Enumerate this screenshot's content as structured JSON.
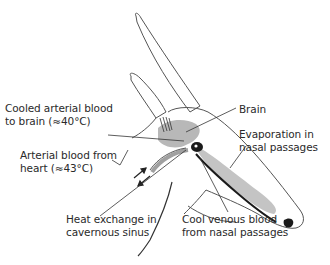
{
  "figure": {
    "colors": {
      "outline": "#555555",
      "shading": "#b8b8b8",
      "dark_vessel": "#1a1a1a",
      "text": "#2a2a2a",
      "background": "#ffffff"
    }
  },
  "labels": {
    "cooled_arterial": {
      "line1": "Cooled arterial blood",
      "line2": "to brain (≈40°C)"
    },
    "arterial_heart": {
      "line1": "Arterial blood from",
      "line2": "heart (≈43°C)"
    },
    "brain": {
      "line1": "Brain"
    },
    "evaporation": {
      "line1": "Evaporation in",
      "line2": "nasal passages"
    },
    "heat_exchange": {
      "line1": "Heat exchange in",
      "line2": "cavernous sinus"
    },
    "cool_venous": {
      "line1": "Cool venous blood",
      "line2": "from nasal passages"
    }
  }
}
